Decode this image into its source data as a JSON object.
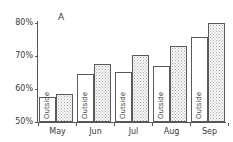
{
  "panel": {
    "label": "A"
  },
  "chart_data": {
    "type": "bar",
    "title": "A",
    "xlabel": "",
    "ylabel": "",
    "ylim": [
      50,
      80
    ],
    "grid": false,
    "legend_position": "none",
    "y_tick_labels": [
      "80%",
      "70%",
      "60%",
      "50%"
    ],
    "y_ticks": [
      80,
      70,
      60,
      50
    ],
    "categories": [
      "May",
      "Jun",
      "Jul",
      "Aug",
      "Sep"
    ],
    "series": [
      {
        "name": "Outside",
        "fill": "plain",
        "values": [
          57.5,
          64.5,
          65.0,
          67.0,
          75.5
        ]
      },
      {
        "name": "Inside",
        "fill": "stipple",
        "values": [
          58.5,
          67.5,
          70.3,
          73.0,
          80.0
        ]
      }
    ],
    "bar_inner_label": "Outside",
    "colors": {
      "axis": "#555555",
      "bar_outline": "#5a5a5a",
      "bar_plain_fill": "#ffffff",
      "bar_stipple_fill": "#fbfbfb",
      "stipple_dot": "#a8a8a8",
      "text": "#3a3a3a",
      "background": "#ffffff"
    }
  }
}
